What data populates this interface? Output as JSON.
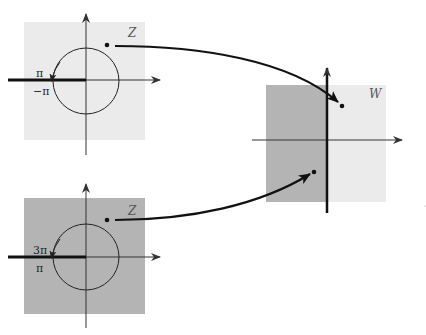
{
  "diagram": {
    "type": "complex-mapping",
    "colors": {
      "light_fill": "#ebebeb",
      "dark_fill": "#b4b4b4",
      "ink": "#111111",
      "axis": "#333333"
    },
    "planes": [
      {
        "id": "z-top",
        "label": "Z",
        "shade": "light",
        "branch_cut": "negative real axis",
        "label_above_cut": "π",
        "label_below_cut": "−π"
      },
      {
        "id": "z-bottom",
        "label": "Z",
        "shade": "dark",
        "branch_cut": "negative real axis",
        "label_above_cut": "3π",
        "label_below_cut": "π"
      },
      {
        "id": "w",
        "label": "W",
        "shade": "left half dark, right half light"
      }
    ],
    "mappings": [
      {
        "from": "z-top point",
        "to": "w point in light (right) half"
      },
      {
        "from": "z-bottom point",
        "to": "w point in dark (left) half"
      }
    ]
  }
}
